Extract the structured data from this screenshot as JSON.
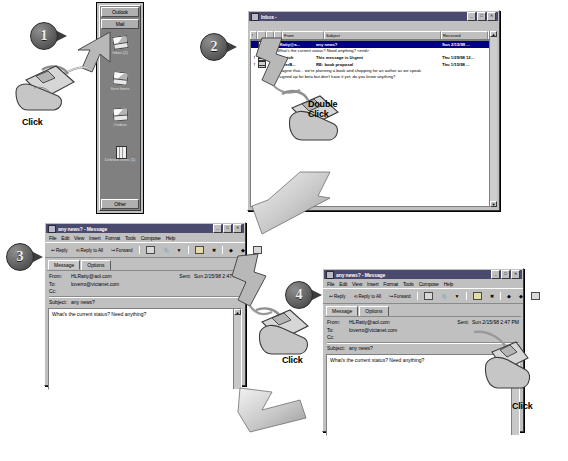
{
  "steps": [
    {
      "num": "1",
      "action_label": "Click"
    },
    {
      "num": "2",
      "action_label": "Double\nClick"
    },
    {
      "num": "3",
      "action_label": "Click"
    },
    {
      "num": "4",
      "action_label": "Click"
    }
  ],
  "labels": {
    "click": "Click",
    "double": "Double",
    "double_click_line2": "Click"
  },
  "outlook_bar": {
    "group_top": "Outlook",
    "group_mail": "Mail",
    "group_other": "Other",
    "shortcuts": [
      {
        "label": "Inbox (2)",
        "icon": "inbox-envelope-icon"
      },
      {
        "label": "Sent Items",
        "icon": "sent-envelope-icon"
      },
      {
        "label": "Outbox",
        "icon": "outbox-envelope-icon"
      },
      {
        "label": "Deleted Items (1)",
        "icon": "trash-can-icon"
      }
    ]
  },
  "inbox_window": {
    "title": "Inbox -",
    "titlebar_icon": "folder-icon",
    "buttons": {
      "minimize": "_",
      "maximize": "□",
      "close": "✕"
    },
    "columns": [
      "",
      "",
      "",
      "",
      "From",
      "Subject",
      "Received",
      ""
    ],
    "rows": [
      {
        "icon": "unread-envelope-icon",
        "from": "HLRatty@a...",
        "subject": "any news?",
        "received": "Sun 2/15/98 ...",
        "preview": "What's the current status?  Need anything?  <end>",
        "selected": true,
        "unread": true
      },
      {
        "icon": "read-envelope-icon",
        "from": "BHBurich",
        "subject": "This message is Urgent",
        "received": "Thu 1/29/98 12...",
        "preview": "",
        "selected": false,
        "unread": true
      },
      {
        "icon": "attachment-envelope-icon",
        "from": "magnerB...",
        "subject": "RE: book proposal",
        "received": "Thu 1/15/98 ...",
        "preview": "Imagine that... we're planning a book and shopping for an author as we speak.",
        "preview2": "I signed up for beta but don't have it yet; do you know anything?",
        "selected": false,
        "unread": true
      }
    ]
  },
  "message_window": {
    "title": "any news? - Message",
    "titlebar_icon": "envelope-icon",
    "buttons": {
      "minimize": "_",
      "maximize": "□",
      "close": "✕"
    },
    "menus": [
      "File",
      "Edit",
      "View",
      "Insert",
      "Format",
      "Tools",
      "Compose",
      "Help"
    ],
    "toolbar": [
      {
        "name": "reply-button",
        "label": "Reply",
        "icon": "reply-arrow-icon"
      },
      {
        "name": "reply-all-button",
        "label": "Reply to All",
        "icon": "reply-all-icon"
      },
      {
        "name": "forward-button",
        "label": "Forward",
        "icon": "forward-arrow-icon"
      },
      {
        "name": "print-button",
        "label": "",
        "icon": "printer-icon"
      },
      {
        "name": "attach-button",
        "label": "",
        "icon": "paperclip-icon"
      },
      {
        "name": "flag-button",
        "label": "",
        "icon": "flag-icon"
      },
      {
        "name": "move-to-folder-button",
        "label": "",
        "icon": "folder-icon"
      },
      {
        "name": "delete-button",
        "label": "",
        "icon": "delete-x-icon"
      },
      {
        "name": "previous-item-button",
        "label": "",
        "icon": "previous-arrow-icon"
      },
      {
        "name": "next-item-button",
        "label": "",
        "icon": "next-arrow-icon"
      },
      {
        "name": "help-button",
        "label": "",
        "icon": "help-pointer-icon"
      }
    ],
    "tabs": [
      {
        "label": "Message",
        "active": true
      },
      {
        "label": "Options",
        "active": false
      }
    ],
    "fields": {
      "from_label": "From:",
      "from_value": "HLRatty@aol.com",
      "sent_label": "Sent:",
      "sent_value": "Sun 2/15/98 2:47 PM",
      "to_label": "To:",
      "to_value": "loverro@vicianet.com",
      "cc_label": "Cc:",
      "cc_value": "",
      "subject_label": "Subject:",
      "subject_value": "any news?"
    },
    "body": "What's the current status?  Need anything?"
  },
  "colors": {
    "titlebar": "#4a4a6e",
    "face": "#c0c0c0",
    "selection": "#000080",
    "callout": "#4a4a4a"
  }
}
